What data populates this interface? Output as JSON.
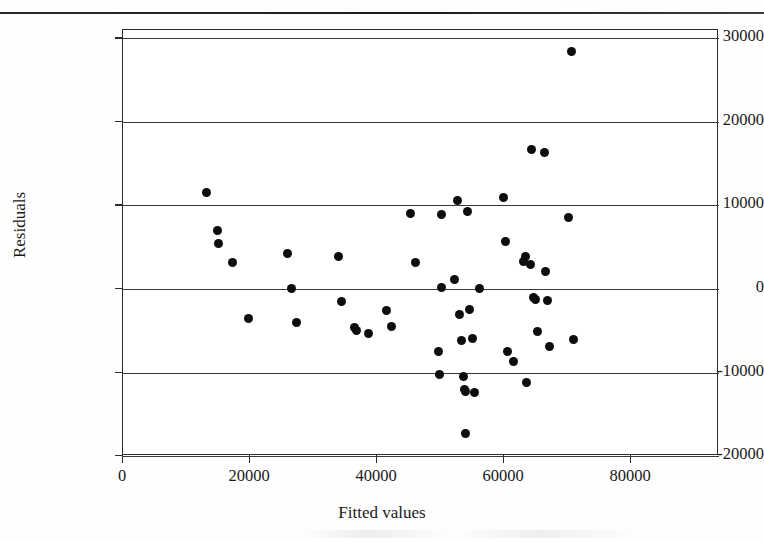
{
  "page": {
    "header_text": "",
    "width": 764,
    "height": 542,
    "background": "#ffffff"
  },
  "chart_data": {
    "type": "scatter",
    "title": "",
    "xlabel": "Fitted values",
    "ylabel": "Residuals",
    "xlim": [
      0,
      80000
    ],
    "ylim": [
      -20000,
      31000
    ],
    "xticks": [
      0,
      20000,
      40000,
      60000,
      80000
    ],
    "xtick_labels": [
      "0",
      "20000",
      "40000",
      "60000",
      "80000"
    ],
    "yticks": [
      -20000,
      -10000,
      0,
      10000,
      20000,
      30000
    ],
    "ytick_labels": [
      "-20000",
      "-10000",
      "0",
      "10000",
      "20000",
      "30000"
    ],
    "grid": "horizontal",
    "gridlines_at": [
      -20000,
      -10000,
      0,
      10000,
      20000,
      30000
    ],
    "legend": null,
    "marker": {
      "shape": "circle",
      "color": "#0d0d0d",
      "size_px": 9
    },
    "series": [
      {
        "name": "Residuals",
        "points": [
          [
            13100,
            11500
          ],
          [
            14800,
            7000
          ],
          [
            15000,
            5500
          ],
          [
            17300,
            3200
          ],
          [
            19800,
            -3500
          ],
          [
            25900,
            4300
          ],
          [
            26500,
            0
          ],
          [
            27300,
            -4000
          ],
          [
            33900,
            3900
          ],
          [
            34400,
            -1500
          ],
          [
            36500,
            -4600
          ],
          [
            36800,
            -5000
          ],
          [
            38600,
            -5300
          ],
          [
            41500,
            -2600
          ],
          [
            42300,
            -4500
          ],
          [
            45300,
            9000
          ],
          [
            46100,
            3200
          ],
          [
            49600,
            -7500
          ],
          [
            49800,
            -10200
          ],
          [
            50100,
            8900
          ],
          [
            50200,
            200
          ],
          [
            52200,
            1100
          ],
          [
            52600,
            10600
          ],
          [
            53000,
            -3000
          ],
          [
            53300,
            -6200
          ],
          [
            53600,
            -10500
          ],
          [
            53700,
            -12000
          ],
          [
            53900,
            -12300
          ],
          [
            53900,
            -17300
          ],
          [
            54300,
            9300
          ],
          [
            54500,
            -2500
          ],
          [
            55000,
            -5900
          ],
          [
            55300,
            -12400
          ],
          [
            56100,
            100
          ],
          [
            59900,
            11000
          ],
          [
            60200,
            5700
          ],
          [
            60500,
            -7500
          ],
          [
            61500,
            -8700
          ],
          [
            63000,
            3300
          ],
          [
            63400,
            3900
          ],
          [
            63600,
            -11200
          ],
          [
            64100,
            2900
          ],
          [
            64400,
            16700
          ],
          [
            64700,
            -1000
          ],
          [
            64900,
            -1300
          ],
          [
            65200,
            -5100
          ],
          [
            66300,
            16300
          ],
          [
            66500,
            2100
          ],
          [
            66900,
            -1400
          ],
          [
            67100,
            -6900
          ],
          [
            70100,
            8500
          ],
          [
            70900,
            -6000
          ],
          [
            70600,
            28400
          ]
        ]
      }
    ]
  },
  "axes": {
    "y_label": "Residuals",
    "x_label": "Fitted values"
  }
}
